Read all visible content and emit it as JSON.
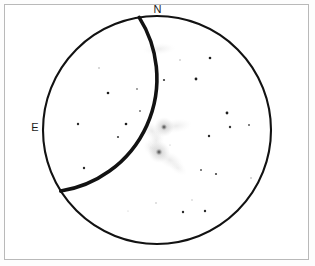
{
  "page": {
    "background_color": "#ffffff",
    "frame_color": "#b9b9b9",
    "ink_color": "#121212"
  },
  "field_of_view": {
    "shape": "circle",
    "center_x": 157,
    "center_y": 130,
    "radius": 114,
    "stroke_color": "#121212",
    "stroke_width": 2.1,
    "fill_color": "#ffffff"
  },
  "cardinal_labels": {
    "north": "N",
    "east": "E"
  },
  "objects": [
    {
      "name": "primary-spiral-galaxy",
      "kind": "galaxy-core",
      "x": 164,
      "y": 127,
      "core_radius": 3.1,
      "halo_radius": 10,
      "opacity": 0.82
    },
    {
      "name": "companion-galaxy",
      "kind": "galaxy-core",
      "x": 159,
      "y": 152,
      "core_radius": 3.4,
      "halo_radius": 11,
      "opacity": 0.8
    },
    {
      "name": "upper-faint-galaxy",
      "kind": "diffuse-smudge",
      "x": 159,
      "y": 49,
      "rx": 17,
      "ry": 6,
      "rotation": -4,
      "opacity": 0.3
    }
  ],
  "nebulosity": [
    {
      "name": "spiral-arm-north-east",
      "cx": 176,
      "cy": 126,
      "rx": 16,
      "ry": 7,
      "rot": -8,
      "opacity": 0.3
    },
    {
      "name": "spiral-arm-north-west",
      "cx": 152,
      "cy": 131,
      "rx": 12,
      "ry": 8,
      "rot": 40,
      "opacity": 0.32
    },
    {
      "name": "spiral-arm-bridge",
      "cx": 156,
      "cy": 141,
      "rx": 8,
      "ry": 12,
      "rot": 20,
      "opacity": 0.3
    },
    {
      "name": "spiral-arm-south",
      "cx": 170,
      "cy": 160,
      "rx": 15,
      "ry": 8,
      "rot": 28,
      "opacity": 0.32
    },
    {
      "name": "spiral-arm-south-tail",
      "cx": 178,
      "cy": 168,
      "rx": 10,
      "ry": 6,
      "rot": 35,
      "opacity": 0.22
    },
    {
      "name": "companion-halo-west",
      "cx": 151,
      "cy": 148,
      "rx": 9,
      "ry": 7,
      "rot": 55,
      "opacity": 0.25
    }
  ],
  "stars": [
    {
      "x": 99,
      "y": 68,
      "r": 0.7,
      "opacity": 0.45
    },
    {
      "x": 108,
      "y": 93,
      "r": 1.3,
      "opacity": 0.95
    },
    {
      "x": 137,
      "y": 89,
      "r": 0.9,
      "opacity": 0.55
    },
    {
      "x": 140,
      "y": 111,
      "r": 1.0,
      "opacity": 0.6
    },
    {
      "x": 164,
      "y": 80,
      "r": 1.1,
      "opacity": 0.85
    },
    {
      "x": 196,
      "y": 79,
      "r": 1.4,
      "opacity": 0.95
    },
    {
      "x": 180,
      "y": 60,
      "r": 0.7,
      "opacity": 0.4
    },
    {
      "x": 210,
      "y": 58,
      "r": 1.3,
      "opacity": 0.95
    },
    {
      "x": 227,
      "y": 113,
      "r": 1.4,
      "opacity": 0.95
    },
    {
      "x": 230,
      "y": 127,
      "r": 1.2,
      "opacity": 0.85
    },
    {
      "x": 249,
      "y": 125,
      "r": 1.0,
      "opacity": 0.7
    },
    {
      "x": 209,
      "y": 136,
      "r": 1.2,
      "opacity": 0.9
    },
    {
      "x": 78,
      "y": 124,
      "r": 1.2,
      "opacity": 0.9
    },
    {
      "x": 126,
      "y": 124,
      "r": 1.3,
      "opacity": 0.95
    },
    {
      "x": 118,
      "y": 137,
      "r": 1.1,
      "opacity": 0.8
    },
    {
      "x": 84,
      "y": 168,
      "r": 1.2,
      "opacity": 0.9
    },
    {
      "x": 201,
      "y": 170,
      "r": 1.0,
      "opacity": 0.7
    },
    {
      "x": 216,
      "y": 174,
      "r": 1.1,
      "opacity": 0.8
    },
    {
      "x": 251,
      "y": 178,
      "r": 0.7,
      "opacity": 0.45
    },
    {
      "x": 192,
      "y": 200,
      "r": 0.7,
      "opacity": 0.3
    },
    {
      "x": 156,
      "y": 203,
      "r": 0.7,
      "opacity": 0.35
    },
    {
      "x": 183,
      "y": 212,
      "r": 1.2,
      "opacity": 0.9
    },
    {
      "x": 205,
      "y": 211,
      "r": 1.2,
      "opacity": 0.9
    },
    {
      "x": 128,
      "y": 211,
      "r": 0.6,
      "opacity": 0.25
    },
    {
      "x": 170,
      "y": 145,
      "r": 0.6,
      "opacity": 0.3
    }
  ]
}
